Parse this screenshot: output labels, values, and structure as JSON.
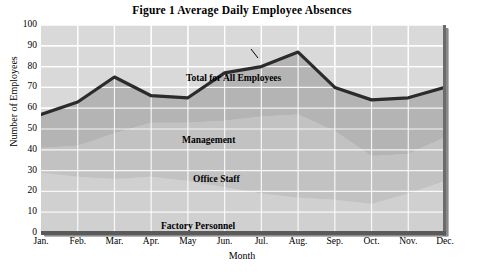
{
  "chart_data": {
    "type": "area",
    "title": "Figure 1  Average Daily Employee Absences",
    "xlabel": "Month",
    "ylabel": "Number of Employees",
    "categories": [
      "Jan.",
      "Feb.",
      "Mar.",
      "Apr.",
      "May",
      "Jun.",
      "Jul.",
      "Aug.",
      "Sep.",
      "Oct.",
      "Nov.",
      "Dec."
    ],
    "yticks": [
      0,
      10,
      20,
      30,
      40,
      50,
      60,
      70,
      80,
      90,
      100
    ],
    "ylim": [
      0,
      100
    ],
    "grid": true,
    "legend_position": "inline-annotations",
    "stacked": true,
    "series": [
      {
        "name": "Factory Personnel",
        "values": [
          29,
          27,
          26,
          27,
          25,
          22,
          19,
          17,
          16,
          14,
          19,
          25
        ]
      },
      {
        "name": "Office Staff",
        "values": [
          12,
          15,
          22,
          26,
          28,
          32,
          37,
          40,
          33,
          23,
          19,
          21
        ]
      },
      {
        "name": "Management",
        "values": [
          16,
          21,
          27,
          13,
          12,
          23,
          24,
          30,
          21,
          27,
          27,
          24
        ]
      }
    ],
    "total_series": {
      "name": "Total for All Employees",
      "values": [
        57,
        63,
        75,
        66,
        65,
        77,
        80,
        87,
        70,
        64,
        65,
        70
      ],
      "style": "thick-black-line"
    },
    "annotations": [
      {
        "text": "Total for All Employees",
        "leader_line": true
      },
      {
        "text": "Management",
        "leader_line": false
      },
      {
        "text": "Office Staff",
        "leader_line": false
      },
      {
        "text": "Factory Personnel",
        "leader_line": false
      }
    ],
    "colors": {
      "plot_background": "#d9d9d9",
      "gridlines": "#ffffff",
      "factory_band": "#d0d0d0",
      "office_band": "#c2c2c2",
      "management_band": "#b4b4b4",
      "total_line": "#2b2b2b",
      "frame_shadow": "#6b6b6b"
    }
  }
}
